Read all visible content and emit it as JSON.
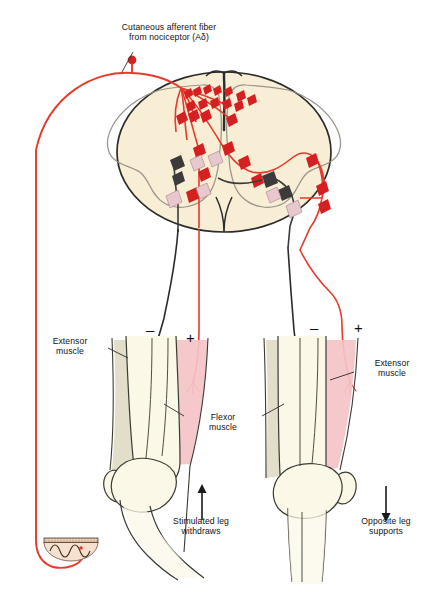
{
  "figure": {
    "background": "#ffffff",
    "width": 437,
    "height": 599
  },
  "labels": {
    "afferent": "Cutaneous afferent  fiber\nfrom nociceptor (Aδ)",
    "extensor_left": "Extensor\nmuscle",
    "extensor_right": "Extensor\nmuscle",
    "flexor": "Flexor\nmuscle",
    "stimulated_leg": "Stimulated leg\nwithdraws",
    "opposite_leg": "Opposite leg\nsupports"
  },
  "signs": {
    "left_extensor": "–",
    "left_flexor": "+",
    "right_flexor": "–",
    "right_extensor": "+"
  },
  "arrows": {
    "stimulated": "up-arrow",
    "opposite": "down-arrow"
  },
  "colors": {
    "afferent_red": "#e8392c",
    "excitatory_neuron": "#d61f20",
    "inhibitory_neuron": "#3b3b3b",
    "pale_neuron": "#e8c8cf",
    "cord_fill": "#f7eed5",
    "cord_outline": "#2b2b2b",
    "gray_matter_line": "#9a958c",
    "muscle_flexor_pink": "#f4c3c8",
    "muscle_extensor_tan": "#e0dbc4",
    "bone_fill": "#fbf8e8",
    "bone_outline": "#3a3a32",
    "skin_fill": "#f8e0cf",
    "skin_band": "#e0c3a8",
    "text": "#111111",
    "background": "#ffffff"
  },
  "anatomy": {
    "spinal_cord": "transverse section with butterfly gray matter",
    "neuron_types": [
      {
        "name": "excitatory-interneuron",
        "color": "#d61f20"
      },
      {
        "name": "inhibitory-interneuron",
        "color": "#3b3b3b"
      },
      {
        "name": "motor-neuron-pale",
        "color": "#e8c8cf"
      }
    ],
    "skin_patch": "half-disc of skin with free nerve ending",
    "legs": [
      "stimulated-leg-left",
      "opposite-leg-right"
    ]
  }
}
